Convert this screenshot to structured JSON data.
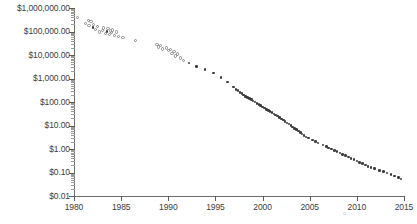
{
  "chart_data": {
    "type": "scatter",
    "title": "",
    "subtitle": "",
    "xlabel": "",
    "ylabel": "",
    "xlim": [
      1980,
      2015
    ],
    "ylim": [
      0.01,
      1000000
    ],
    "yscale": "log",
    "xscale": "linear",
    "grid": false,
    "legend": null,
    "x_ticks": [
      1980,
      1985,
      1990,
      1995,
      2000,
      2005,
      2010,
      2015
    ],
    "x_tick_labels": [
      "1980",
      "1985",
      "1990",
      "1995",
      "2000",
      "2005",
      "2010",
      "2015"
    ],
    "y_ticks": [
      1000000,
      100000,
      10000,
      1000,
      100,
      10,
      1,
      0.1,
      0.01
    ],
    "y_tick_labels": [
      "$1,000,000.00",
      "$100,000.00",
      "$10,000.00",
      "$1,000.00",
      "$100.00",
      "$10.00",
      "$1.00",
      "$0.10",
      "$0.01"
    ],
    "marker_colors": {
      "open": "#8a8a8a",
      "filled": "#3c3c3c"
    },
    "axis_color": "#6e6e6e",
    "text_color": "#3d3d3d",
    "background": "#ffffff",
    "series": [
      {
        "name": "cost",
        "marker": "circle",
        "points": [
          [
            1980.4,
            400000,
            "open"
          ],
          [
            1981.2,
            220000,
            "open"
          ],
          [
            1981.5,
            300000,
            "open"
          ],
          [
            1981.6,
            180000,
            "open"
          ],
          [
            1981.8,
            260000,
            "open"
          ],
          [
            1982.0,
            150000,
            "filled"
          ],
          [
            1982.1,
            200000,
            "open"
          ],
          [
            1982.3,
            120000,
            "open"
          ],
          [
            1982.5,
            160000,
            "open"
          ],
          [
            1982.7,
            95000,
            "open"
          ],
          [
            1983.0,
            110000,
            "open"
          ],
          [
            1983.1,
            140000,
            "open"
          ],
          [
            1983.3,
            85000,
            "open"
          ],
          [
            1983.5,
            100000,
            "filled"
          ],
          [
            1983.6,
            130000,
            "open"
          ],
          [
            1983.8,
            75000,
            "open"
          ],
          [
            1983.9,
            105000,
            "open"
          ],
          [
            1984.0,
            90000,
            "open"
          ],
          [
            1984.1,
            115000,
            "open"
          ],
          [
            1984.3,
            70000,
            "open"
          ],
          [
            1984.5,
            95000,
            "open"
          ],
          [
            1984.7,
            60000,
            "open"
          ],
          [
            1985.2,
            55000,
            "open"
          ],
          [
            1986.5,
            40000,
            "open"
          ],
          [
            1988.8,
            28000,
            "open"
          ],
          [
            1989.0,
            22000,
            "open"
          ],
          [
            1989.2,
            25000,
            "open"
          ],
          [
            1989.4,
            18000,
            "open"
          ],
          [
            1989.8,
            20000,
            "open"
          ],
          [
            1990.0,
            15000,
            "open"
          ],
          [
            1990.2,
            17000,
            "open"
          ],
          [
            1990.4,
            12000,
            "open"
          ],
          [
            1990.6,
            14000,
            "open"
          ],
          [
            1990.8,
            9000,
            "open"
          ],
          [
            1991.0,
            11000,
            "open"
          ],
          [
            1991.3,
            7500,
            "open"
          ],
          [
            1991.6,
            6000,
            "open"
          ],
          [
            1992.2,
            4500,
            "filled"
          ],
          [
            1993.0,
            3200,
            "filled"
          ],
          [
            1993.9,
            2400,
            "filled"
          ],
          [
            1994.8,
            1700,
            "filled"
          ],
          [
            1995.6,
            1100,
            "filled"
          ],
          [
            1996.3,
            700,
            "filled"
          ],
          [
            1996.9,
            430,
            "filled"
          ],
          [
            1997.2,
            350,
            "filled"
          ],
          [
            1997.4,
            300,
            "filled"
          ],
          [
            1997.6,
            260,
            "filled"
          ],
          [
            1997.8,
            230,
            "filled"
          ],
          [
            1998.0,
            200,
            "filled"
          ],
          [
            1998.2,
            175,
            "filled"
          ],
          [
            1998.4,
            155,
            "filled"
          ],
          [
            1998.6,
            140,
            "filled"
          ],
          [
            1998.8,
            125,
            "filled"
          ],
          [
            1999.0,
            110,
            "filled"
          ],
          [
            1999.2,
            98,
            "filled"
          ],
          [
            1999.4,
            88,
            "filled"
          ],
          [
            1999.6,
            78,
            "filled"
          ],
          [
            1999.8,
            70,
            "filled"
          ],
          [
            2000.0,
            62,
            "filled"
          ],
          [
            2000.2,
            55,
            "filled"
          ],
          [
            2000.4,
            49,
            "filled"
          ],
          [
            2000.6,
            44,
            "filled"
          ],
          [
            2000.8,
            39,
            "filled"
          ],
          [
            2001.0,
            35,
            "filled"
          ],
          [
            2001.2,
            31,
            "filled"
          ],
          [
            2001.4,
            28,
            "filled"
          ],
          [
            2001.6,
            25,
            "filled"
          ],
          [
            2001.8,
            22,
            "filled"
          ],
          [
            2002.0,
            19,
            "filled"
          ],
          [
            2002.2,
            17,
            "filled"
          ],
          [
            2002.4,
            15,
            "filled"
          ],
          [
            2002.6,
            13,
            "filled"
          ],
          [
            2002.8,
            11.5,
            "filled"
          ],
          [
            2003.0,
            10,
            "filled"
          ],
          [
            2003.2,
            8.8,
            "filled"
          ],
          [
            2003.4,
            7.6,
            "filled"
          ],
          [
            2003.6,
            6.6,
            "filled"
          ],
          [
            2003.8,
            5.8,
            "filled"
          ],
          [
            2004.0,
            5.0,
            "filled"
          ],
          [
            2004.2,
            4.4,
            "filled"
          ],
          [
            2004.4,
            3.8,
            "filled"
          ],
          [
            2004.6,
            3.3,
            "filled"
          ],
          [
            2004.9,
            2.9,
            "filled"
          ],
          [
            2005.3,
            2.4,
            "filled"
          ],
          [
            2005.6,
            2.1,
            "filled"
          ],
          [
            2005.9,
            1.8,
            "filled"
          ],
          [
            2006.4,
            1.5,
            "filled"
          ],
          [
            2006.8,
            1.25,
            "filled"
          ],
          [
            2007.0,
            1.1,
            "filled"
          ],
          [
            2007.3,
            0.98,
            "filled"
          ],
          [
            2007.6,
            0.88,
            "filled"
          ],
          [
            2007.9,
            0.78,
            "filled"
          ],
          [
            2008.2,
            0.68,
            "filled"
          ],
          [
            2008.5,
            0.6,
            "filled"
          ],
          [
            2008.8,
            0.52,
            "filled"
          ],
          [
            2009.1,
            0.45,
            "filled"
          ],
          [
            2009.4,
            0.4,
            "filled"
          ],
          [
            2009.7,
            0.35,
            "filled"
          ],
          [
            2010.0,
            0.31,
            "filled"
          ],
          [
            2010.3,
            0.27,
            "filled"
          ],
          [
            2010.6,
            0.24,
            "filled"
          ],
          [
            2010.9,
            0.21,
            "filled"
          ],
          [
            2011.2,
            0.185,
            "filled"
          ],
          [
            2011.5,
            0.165,
            "filled"
          ],
          [
            2011.9,
            0.145,
            "filled"
          ],
          [
            2012.4,
            0.125,
            "filled"
          ],
          [
            2012.8,
            0.11,
            "filled"
          ],
          [
            2013.2,
            0.095,
            "filled"
          ],
          [
            2013.6,
            0.082,
            "filled"
          ],
          [
            2014.0,
            0.07,
            "filled"
          ],
          [
            2014.4,
            0.06,
            "filled"
          ],
          [
            2014.7,
            0.052,
            "filled"
          ]
        ]
      }
    ]
  }
}
